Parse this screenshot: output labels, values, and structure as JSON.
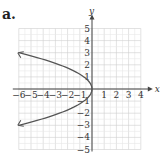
{
  "panel_label": "a.",
  "chart_data": {
    "type": "line",
    "title": "",
    "xlabel": "x",
    "ylabel": "y",
    "xlim": [
      -6,
      4
    ],
    "ylim": [
      -5,
      5
    ],
    "grid": true,
    "x_ticks": [
      "-6",
      "-5",
      "-4",
      "-3",
      "-2",
      "-1",
      "1",
      "2",
      "3",
      "4"
    ],
    "y_ticks": [
      "5",
      "4",
      "3",
      "2",
      "1",
      "-1",
      "-2",
      "-3",
      "-4",
      "-5"
    ],
    "series": [
      {
        "name": "x = -(2/3)y^2",
        "equation": "x = -(2/3)y^2",
        "points": [
          [
            -6,
            3
          ],
          [
            -2.67,
            2
          ],
          [
            -0.67,
            1
          ],
          [
            0,
            0
          ],
          [
            -0.67,
            -1
          ],
          [
            -2.67,
            -2
          ],
          [
            -6,
            -3
          ]
        ],
        "arrows_at_ends": true,
        "color": "#555555"
      }
    ]
  }
}
